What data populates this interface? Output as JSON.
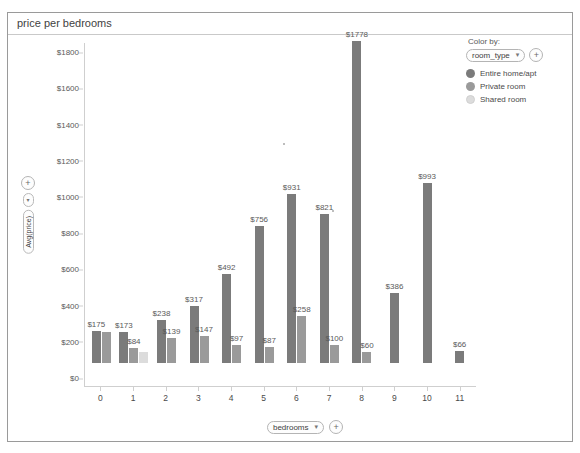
{
  "window": {
    "title": "price per bedrooms"
  },
  "legend": {
    "caption": "Color by:",
    "field_pill": "room_type",
    "caret_glyph": "▾",
    "add_glyph": "+",
    "items": [
      {
        "label": "Entire home/apt",
        "color": "#7b7b7b"
      },
      {
        "label": "Private room",
        "color": "#9a9a9a"
      },
      {
        "label": "Shared room",
        "color": "#dcdcdc"
      }
    ]
  },
  "y_axis_control": {
    "pill": "Avg(price)",
    "caret_glyph": "▾",
    "add_glyph": "+"
  },
  "x_axis_control": {
    "pill": "bedrooms",
    "caret_glyph": "▾",
    "add_glyph": "+"
  },
  "chart_data": {
    "type": "bar",
    "title": "price per bedrooms",
    "xlabel": "bedrooms",
    "ylabel": "Avg(price)",
    "ylim": [
      0,
      1900
    ],
    "yticks": [
      0,
      200,
      400,
      600,
      800,
      1000,
      1200,
      1400,
      1600,
      1800
    ],
    "ytick_labels": [
      "$0",
      "$200",
      "$400",
      "$600",
      "$800",
      "$1000",
      "$1200",
      "$1400",
      "$1600",
      "$1800"
    ],
    "categories": [
      "0",
      "1",
      "2",
      "3",
      "4",
      "5",
      "6",
      "7",
      "8",
      "9",
      "10",
      "11"
    ],
    "grid": false,
    "legend_position": "top-right",
    "series": [
      {
        "name": "Entire home/apt",
        "color": "#7b7b7b",
        "values": [
          175,
          173,
          238,
          317,
          492,
          756,
          931,
          821,
          1778,
          386,
          993,
          66
        ],
        "labels": [
          "$175",
          "$173",
          "$238",
          "$317",
          "$492",
          "$756",
          "$931",
          "$821",
          "$1778",
          "$386",
          "$993",
          "$66"
        ]
      },
      {
        "name": "Private room",
        "color": "#9a9a9a",
        "values": [
          172,
          84,
          139,
          147,
          97,
          87,
          258,
          100,
          60,
          null,
          null,
          null
        ],
        "labels": [
          "",
          "$84",
          "$139",
          "$147",
          "$97",
          "$87",
          "$258",
          "$100",
          "$60",
          "",
          "",
          ""
        ]
      },
      {
        "name": "Shared room",
        "color": "#dcdcdc",
        "values": [
          null,
          62,
          null,
          null,
          null,
          null,
          null,
          null,
          null,
          null,
          null,
          null
        ],
        "labels": [
          "",
          "",
          "",
          "",
          "",
          "",
          "",
          "",
          "",
          "",
          "",
          ""
        ]
      }
    ]
  }
}
